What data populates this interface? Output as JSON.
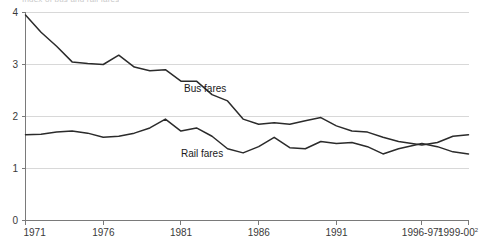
{
  "chart_data": {
    "type": "line",
    "title": "Index of bus and rail fares",
    "xlabel": "",
    "ylabel": "",
    "ylim": [
      0,
      4
    ],
    "yticks": [
      0,
      1,
      2,
      3,
      4
    ],
    "ytick_labels": [
      "0",
      "1",
      "2",
      "3",
      "4"
    ],
    "grid": true,
    "legend_position": "inline-annotation",
    "xtick_labels": [
      "1971",
      "1976",
      "1981",
      "1986",
      "1991",
      "1996-97",
      "1999-00"
    ],
    "xtick_superscripts": [
      "",
      "",
      "",
      "",
      "",
      "2",
      "2"
    ],
    "xtick_years": [
      1971,
      1976,
      1981,
      1986,
      1991,
      1996.5,
      1999.5
    ],
    "x": [
      1971,
      1972,
      1973,
      1974,
      1975,
      1976,
      1977,
      1978,
      1979,
      1980,
      1981,
      1982,
      1983,
      1984,
      1985,
      1986,
      1987,
      1988,
      1989,
      1990,
      1991,
      1992,
      1993,
      1994,
      1995,
      1996.5,
      1997.5,
      1998.5,
      1999.5
    ],
    "series": [
      {
        "name": "Bus fares",
        "values": [
          3.95,
          3.62,
          3.35,
          3.05,
          3.02,
          3.0,
          3.18,
          2.95,
          2.88,
          2.9,
          2.68,
          2.68,
          2.42,
          2.3,
          1.95,
          1.85,
          1.88,
          1.85,
          1.92,
          1.98,
          1.82,
          1.72,
          1.7,
          1.6,
          1.52,
          1.45,
          1.5,
          1.62,
          1.65
        ],
        "label_x": 1981.2,
        "label_y": 2.52,
        "color": "#2b2b2b"
      },
      {
        "name": "Rail fares",
        "values": [
          1.65,
          1.66,
          1.7,
          1.72,
          1.68,
          1.6,
          1.62,
          1.68,
          1.78,
          1.95,
          1.72,
          1.78,
          1.62,
          1.38,
          1.3,
          1.42,
          1.6,
          1.4,
          1.38,
          1.52,
          1.48,
          1.5,
          1.42,
          1.28,
          1.38,
          1.48,
          1.42,
          1.32,
          1.28
        ],
        "label_x": 1981.0,
        "label_y": 1.28,
        "color": "#2b2b2b"
      }
    ]
  }
}
